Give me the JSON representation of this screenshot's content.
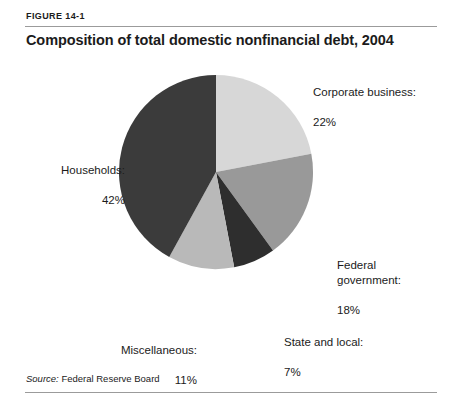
{
  "figure": {
    "label": "FIGURE 14-1",
    "title": "Composition of total domestic nonfinancial debt, 2004",
    "source_prefix": "Source:",
    "source_text": " Federal Reserve Board"
  },
  "labels": {
    "corporate": {
      "name": "Corporate business:",
      "value": "22%"
    },
    "federal": {
      "name": "Federal\ngovernment:",
      "value": "18%"
    },
    "state": {
      "name": "State and local:",
      "value": "7%"
    },
    "misc": {
      "name": "Miscellaneous:",
      "value": "11%"
    },
    "households": {
      "name": "Households:",
      "value": "42%"
    }
  },
  "chart_data": {
    "type": "pie",
    "title": "Composition of total domestic nonfinancial debt, 2004",
    "subtitle": "FIGURE 14-1",
    "source": "Source: Federal Reserve Board",
    "unit": "percent",
    "total": 100,
    "start_angle_deg": 0,
    "direction": "clockwise",
    "legend": "none (direct labels)",
    "categories": [
      "Corporate business",
      "Federal government",
      "State and local",
      "Miscellaneous",
      "Households"
    ],
    "values": [
      22,
      18,
      7,
      11,
      42
    ],
    "colors": [
      "#d7d7d7",
      "#999999",
      "#2e2e2e",
      "#b9b9b9",
      "#3b3b3b"
    ],
    "slices": [
      {
        "label": "Corporate business",
        "value": 22,
        "display": "22%",
        "color": "#d7d7d7",
        "start_deg": 0,
        "end_deg": 79.2
      },
      {
        "label": "Federal government",
        "value": 18,
        "display": "18%",
        "color": "#999999",
        "start_deg": 79.2,
        "end_deg": 144.0
      },
      {
        "label": "State and local",
        "value": 7,
        "display": "7%",
        "color": "#2e2e2e",
        "start_deg": 144.0,
        "end_deg": 169.2
      },
      {
        "label": "Miscellaneous",
        "value": 11,
        "display": "11%",
        "color": "#b9b9b9",
        "start_deg": 169.2,
        "end_deg": 208.8
      },
      {
        "label": "Households",
        "value": 42,
        "display": "42%",
        "color": "#3b3b3b",
        "start_deg": 208.8,
        "end_deg": 360.0
      }
    ]
  }
}
